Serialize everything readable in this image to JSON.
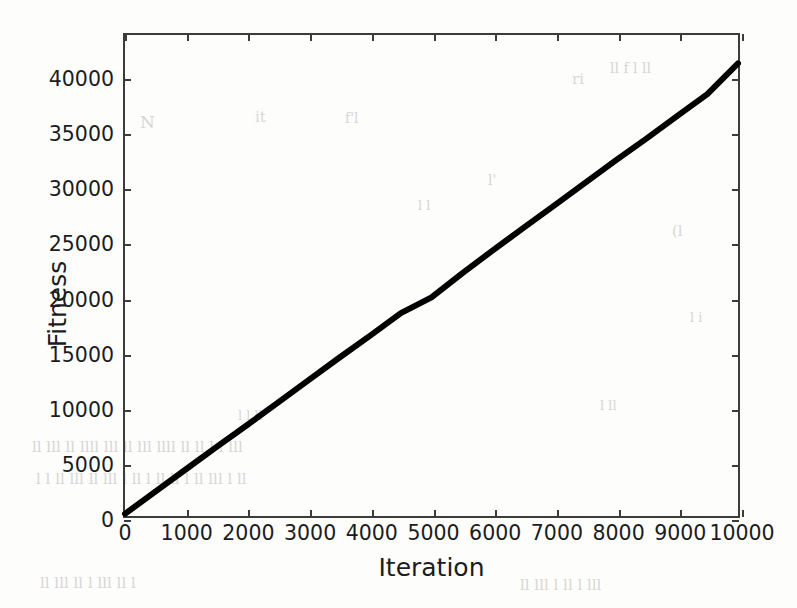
{
  "chart_data": {
    "type": "line",
    "title": "",
    "xlabel": "Iteration",
    "ylabel": "Fitness",
    "xlim": [
      0,
      10000
    ],
    "ylim": [
      0,
      44000
    ],
    "grid": false,
    "legend": null,
    "xticks": [
      0,
      1000,
      2000,
      3000,
      4000,
      5000,
      6000,
      7000,
      8000,
      9000,
      10000
    ],
    "xticklabels": [
      "0",
      "1000",
      "2000",
      "3000",
      "4000",
      "5000",
      "6000",
      "7000",
      "8000",
      "9000",
      "10000"
    ],
    "yticks": [
      0,
      5000,
      10000,
      15000,
      20000,
      25000,
      30000,
      35000,
      40000
    ],
    "yticklabels": [
      "0",
      "5000",
      "10000",
      "15000",
      "20000",
      "25000",
      "30000",
      "35000",
      "40000"
    ],
    "series": [
      {
        "name": "Fitness",
        "color": "#000000",
        "linewidth": 6,
        "x": [
          0,
          500,
          1000,
          1500,
          2000,
          2500,
          3000,
          3500,
          4000,
          4500,
          5000,
          5500,
          6000,
          6500,
          7000,
          7500,
          8000,
          8500,
          9000,
          9500,
          10000
        ],
        "y": [
          200,
          2250,
          4300,
          6350,
          8350,
          10400,
          12450,
          14500,
          16500,
          18550,
          20000,
          22200,
          24300,
          26350,
          28400,
          30450,
          32500,
          34500,
          36550,
          38600,
          41400
        ]
      }
    ]
  },
  "artifacts": [
    {
      "text": "N",
      "left": 140,
      "top": 112,
      "size": 17
    },
    {
      "text": "it",
      "left": 255,
      "top": 108,
      "size": 15
    },
    {
      "text": "f'l",
      "left": 345,
      "top": 110,
      "size": 14
    },
    {
      "text": "ri",
      "left": 572,
      "top": 70,
      "size": 15
    },
    {
      "text": "ll f l ll",
      "left": 610,
      "top": 60,
      "size": 14
    },
    {
      "text": "(l",
      "left": 672,
      "top": 222,
      "size": 15
    },
    {
      "text": "l'",
      "left": 488,
      "top": 172,
      "size": 14
    },
    {
      "text": "l l",
      "left": 418,
      "top": 198,
      "size": 13
    },
    {
      "text": "l i",
      "left": 690,
      "top": 310,
      "size": 13
    },
    {
      "text": "ll lll  ll llll  lll ll lll     llll  ll ll l   l lll",
      "left": 32,
      "top": 438,
      "size": 15
    },
    {
      "text": "l  l ll    lll ll lll  l  ll l ll   ll  l ll  lll l ll",
      "left": 36,
      "top": 470,
      "size": 15
    },
    {
      "text": "ll   lll  ll l lll  ll l",
      "left": 40,
      "top": 574,
      "size": 15
    },
    {
      "text": "ll lll l ll  l lll",
      "left": 520,
      "top": 576,
      "size": 15
    },
    {
      "text": "l l ll",
      "left": 238,
      "top": 408,
      "size": 13
    },
    {
      "text": "l ll",
      "left": 600,
      "top": 398,
      "size": 13
    }
  ]
}
